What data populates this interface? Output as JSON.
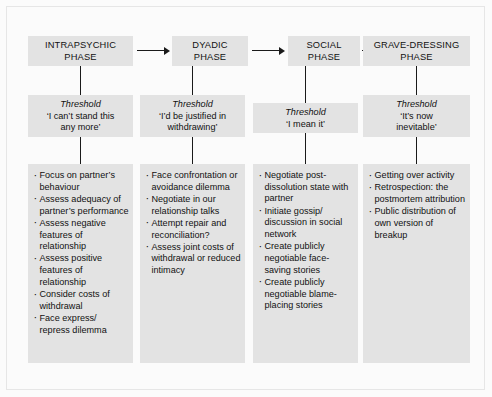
{
  "diagram": {
    "colors": {
      "box_fill": "#e3e3e3",
      "background": "#fbfbfb",
      "text": "#111111",
      "connector": "#1a1a1a",
      "frame_border": "#e6e6e6"
    },
    "columns": [
      {
        "id": "intrapsychic",
        "phase_label": "INTRAPSYCHIC\nPHASE",
        "threshold_title": "Threshold",
        "threshold_quote": "‘I can’t stand this\nany more’",
        "items": [
          "Focus on partner’s behaviour",
          "Assess adequacy of partner’s performance",
          "Assess negative features of relationship",
          "Assess positive features of relationship",
          "Consider costs of withdrawal",
          "Face express/ repress dilemma"
        ]
      },
      {
        "id": "dyadic",
        "phase_label": "DYADIC\nPHASE",
        "threshold_title": "Threshold",
        "threshold_quote": "‘I’d be justified in\nwithdrawing’",
        "items": [
          "Face confrontation or avoidance dilemma",
          "Negotiate in our relationship talks",
          "Attempt repair and reconciliation?",
          "Assess joint costs of withdrawal or reduced intimacy"
        ]
      },
      {
        "id": "social",
        "phase_label": "SOCIAL\nPHASE",
        "threshold_title": "Threshold",
        "threshold_quote": "‘I mean it’",
        "items": [
          "Negotiate post-dissolution state with partner",
          "Initiate gossip/ discussion in social network",
          "Create publicly negotiable face-saving stories",
          "Create publicly negotiable blame-placing stories"
        ]
      },
      {
        "id": "grave-dressing",
        "phase_label": "GRAVE-DRESSING\nPHASE",
        "threshold_title": "Threshold",
        "threshold_quote": "‘It’s now\ninevitable’",
        "items": [
          "Getting over activity",
          "Retrospection: the postmortem attribution",
          "Public distribution of own version of breakup"
        ]
      }
    ],
    "arrows": [
      {
        "id": "arrow-intrapsychic-to-dyadic",
        "label": "flows to"
      },
      {
        "id": "arrow-dyadic-to-social",
        "label": "flows to"
      },
      {
        "id": "arrow-social-to-grave-dressing",
        "label": "flows to"
      }
    ]
  }
}
